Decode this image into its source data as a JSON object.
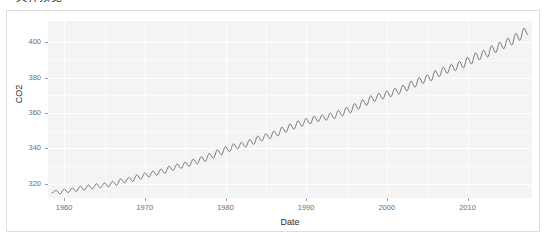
{
  "caption": {
    "text": "‣ 文件预览"
  },
  "chart_data": {
    "type": "line",
    "title": "",
    "xlabel": "Date",
    "ylabel": "CO2",
    "xlim": [
      1958,
      2018
    ],
    "ylim": [
      312,
      412
    ],
    "grid": true,
    "legend": "none",
    "line_color": "#595959",
    "panel_color": "#f4f4f4",
    "gridline_color": "#ffffff",
    "xticks": [
      1960,
      1970,
      1980,
      1990,
      2000,
      2010
    ],
    "xtick_labels": [
      "1960",
      "1970",
      "1980",
      "1990",
      "2000",
      "2010"
    ],
    "yticks": [
      320,
      340,
      360,
      380,
      400
    ],
    "ytick_labels": [
      "320",
      "340",
      "360",
      "380",
      "400"
    ],
    "series": [
      {
        "name": "CO2",
        "description": "Monthly mean atmospheric CO2 concentration with seasonal cycle (Keeling curve)",
        "x": [
          1958.5,
          1959.0,
          1959.5,
          1960.0,
          1960.5,
          1961.0,
          1961.5,
          1962.0,
          1962.5,
          1963.0,
          1963.5,
          1964.0,
          1964.5,
          1965.0,
          1965.5,
          1966.0,
          1966.5,
          1967.0,
          1967.5,
          1968.0,
          1968.5,
          1969.0,
          1969.5,
          1970.0,
          1970.5,
          1971.0,
          1971.5,
          1972.0,
          1972.5,
          1973.0,
          1973.5,
          1974.0,
          1974.5,
          1975.0,
          1975.5,
          1976.0,
          1976.5,
          1977.0,
          1977.5,
          1978.0,
          1978.5,
          1979.0,
          1979.5,
          1980.0,
          1980.5,
          1981.0,
          1981.5,
          1982.0,
          1982.5,
          1983.0,
          1983.5,
          1984.0,
          1984.5,
          1985.0,
          1985.5,
          1986.0,
          1986.5,
          1987.0,
          1987.5,
          1988.0,
          1988.5,
          1989.0,
          1989.5,
          1990.0,
          1990.5,
          1991.0,
          1991.5,
          1992.0,
          1992.5,
          1993.0,
          1993.5,
          1994.0,
          1994.5,
          1995.0,
          1995.5,
          1996.0,
          1996.5,
          1997.0,
          1997.5,
          1998.0,
          1998.5,
          1999.0,
          1999.5,
          2000.0,
          2000.5,
          2001.0,
          2001.5,
          2002.0,
          2002.5,
          2003.0,
          2003.5,
          2004.0,
          2004.5,
          2005.0,
          2005.5,
          2006.0,
          2006.5,
          2007.0,
          2007.5,
          2008.0,
          2008.5,
          2009.0,
          2009.5,
          2010.0,
          2010.5,
          2011.0,
          2011.5,
          2012.0,
          2012.5,
          2013.0,
          2013.5,
          2014.0,
          2014.5,
          2015.0,
          2015.5,
          2016.0,
          2016.5,
          2017.0,
          2017.5
        ],
        "values": [
          315.0,
          316.3,
          314.4,
          317.0,
          315.1,
          317.7,
          315.8,
          318.6,
          316.5,
          319.3,
          317.2,
          320.0,
          317.8,
          320.5,
          318.3,
          321.4,
          319.2,
          322.8,
          320.6,
          323.6,
          321.3,
          325.0,
          322.7,
          326.2,
          323.9,
          327.2,
          324.9,
          328.3,
          326.0,
          330.0,
          327.6,
          331.2,
          328.7,
          332.2,
          329.8,
          333.9,
          331.3,
          335.3,
          332.7,
          337.2,
          334.5,
          339.2,
          336.4,
          341.0,
          338.2,
          342.6,
          339.8,
          343.5,
          340.8,
          345.0,
          342.3,
          347.0,
          344.2,
          348.3,
          345.5,
          349.8,
          347.0,
          352.0,
          349.1,
          353.9,
          350.9,
          355.6,
          352.5,
          357.0,
          353.9,
          358.3,
          355.2,
          358.9,
          355.9,
          359.9,
          356.8,
          361.5,
          358.4,
          363.2,
          360.0,
          365.4,
          362.2,
          367.5,
          364.3,
          369.8,
          366.6,
          371.1,
          367.9,
          372.5,
          369.2,
          374.0,
          370.7,
          375.7,
          372.4,
          378.0,
          374.6,
          380.1,
          376.7,
          381.6,
          378.2,
          384.0,
          380.5,
          386.0,
          382.4,
          387.6,
          383.9,
          389.2,
          385.5,
          391.5,
          387.8,
          394.0,
          390.1,
          395.5,
          391.6,
          398.0,
          394.1,
          400.1,
          396.3,
          402.3,
          398.4,
          405.0,
          401.0,
          408.0,
          404.3
        ]
      }
    ]
  }
}
